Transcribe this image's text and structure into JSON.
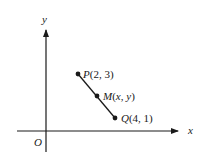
{
  "diagram": {
    "type": "coordinate-plane",
    "axes": {
      "x_label": "x",
      "y_label": "y",
      "origin_label": "O"
    },
    "points": [
      {
        "name": "P",
        "label": "P(2, 3)",
        "x": 2,
        "y": 3
      },
      {
        "name": "M",
        "label": "M(x, y)",
        "x": "x",
        "y": "y"
      },
      {
        "name": "Q",
        "label": "Q(4, 1)",
        "x": 4,
        "y": 1
      }
    ],
    "segment": {
      "from": "P",
      "to": "Q",
      "midpoint": "M"
    },
    "colors": {
      "stroke": "#1a1a1a",
      "background": "#ffffff"
    }
  }
}
